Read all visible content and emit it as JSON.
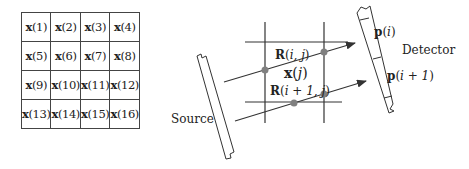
{
  "pixel_grid": {
    "rows": 4,
    "cols": 4,
    "symbol": "x",
    "cells": [
      [
        "(1)",
        "(2)",
        "(3)",
        "(4)"
      ],
      [
        "(5)",
        "(6)",
        "(7)",
        "(8)"
      ],
      [
        "(9)",
        "(10)",
        "(11)",
        "(12)"
      ],
      [
        "(13)",
        "(14)",
        "(15)",
        "(16)"
      ]
    ]
  },
  "projection": {
    "source_label": "Source",
    "detector_label": "Detector",
    "pixel_label": {
      "symbol": "x",
      "arg": "j"
    },
    "ray_weight_labels": [
      {
        "symbol": "R",
        "arg": "i, j"
      },
      {
        "symbol": "R",
        "arg": "i + 1, j"
      }
    ],
    "detector_bins": [
      {
        "symbol": "p",
        "arg": "i"
      },
      {
        "symbol": "p",
        "arg": "i + 1"
      }
    ],
    "colors": {
      "line": "#333333",
      "intersection_dot": "#808080",
      "text": "#222222"
    }
  }
}
